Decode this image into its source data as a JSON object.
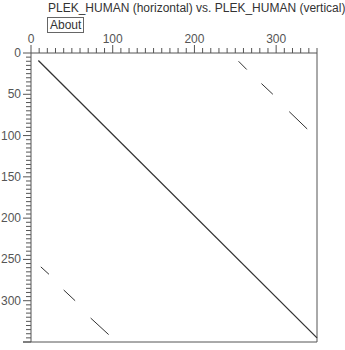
{
  "header": {
    "title": "PLEK_HUMAN (horizontal) vs. PLEK_HUMAN (vertical)",
    "about_label": "About"
  },
  "chart_data": {
    "type": "dotplot",
    "title": "PLEK_HUMAN (horizontal) vs. PLEK_HUMAN (vertical)",
    "xlabel": "PLEK_HUMAN (horizontal)",
    "ylabel": "PLEK_HUMAN (vertical)",
    "xlim": [
      0,
      350
    ],
    "ylim": [
      0,
      350
    ],
    "y_inverted": true,
    "x_ticks": [
      0,
      100,
      200,
      300
    ],
    "y_ticks": [
      0,
      50,
      100,
      150,
      200,
      250,
      300
    ],
    "grid": false,
    "line_color": "#333333",
    "segments": [
      {
        "x": [
          9,
          350
        ],
        "y": [
          9,
          345
        ],
        "label": "main diagonal"
      },
      {
        "x": [
          254,
          264
        ],
        "y": [
          10,
          20
        ]
      },
      {
        "x": [
          282,
          296
        ],
        "y": [
          37,
          50
        ]
      },
      {
        "x": [
          316,
          338
        ],
        "y": [
          71,
          92
        ]
      },
      {
        "x": [
          12,
          22
        ],
        "y": [
          259,
          268
        ]
      },
      {
        "x": [
          40,
          54
        ],
        "y": [
          287,
          300
        ]
      },
      {
        "x": [
          73,
          95
        ],
        "y": [
          321,
          341
        ]
      }
    ]
  }
}
